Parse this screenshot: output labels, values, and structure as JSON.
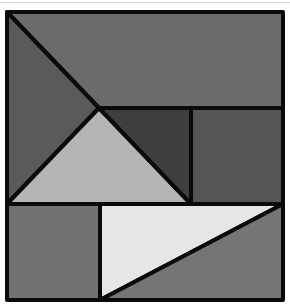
{
  "figure": {
    "type": "tangram-square-dissection",
    "stroke_color": "#0a0a0a",
    "pieces": [
      {
        "name": "top-rectangle-region",
        "points": "7,12 283,12 283,108 99,108",
        "fill": "#6b6b6b"
      },
      {
        "name": "left-triangle",
        "points": "7,12 99,108 7,204",
        "fill": "#5a5a5a"
      },
      {
        "name": "center-light-triangle",
        "points": "99,108 7,204 191,204",
        "fill": "#b5b5b5"
      },
      {
        "name": "center-dark-triangle",
        "points": "99,108 191,108 191,204",
        "fill": "#3f3f3f"
      },
      {
        "name": "right-rectangle",
        "points": "191,108 283,108 283,204 191,204",
        "fill": "#555555"
      },
      {
        "name": "bottom-left-rectangle",
        "points": "7,204 100,204 100,300 7,300",
        "fill": "#727272"
      },
      {
        "name": "bottom-white-triangle",
        "points": "100,204 283,204 100,300",
        "fill": "#e6e6e6"
      },
      {
        "name": "bottom-right-triangle",
        "points": "283,204 283,300 100,300",
        "fill": "#757575"
      }
    ]
  }
}
